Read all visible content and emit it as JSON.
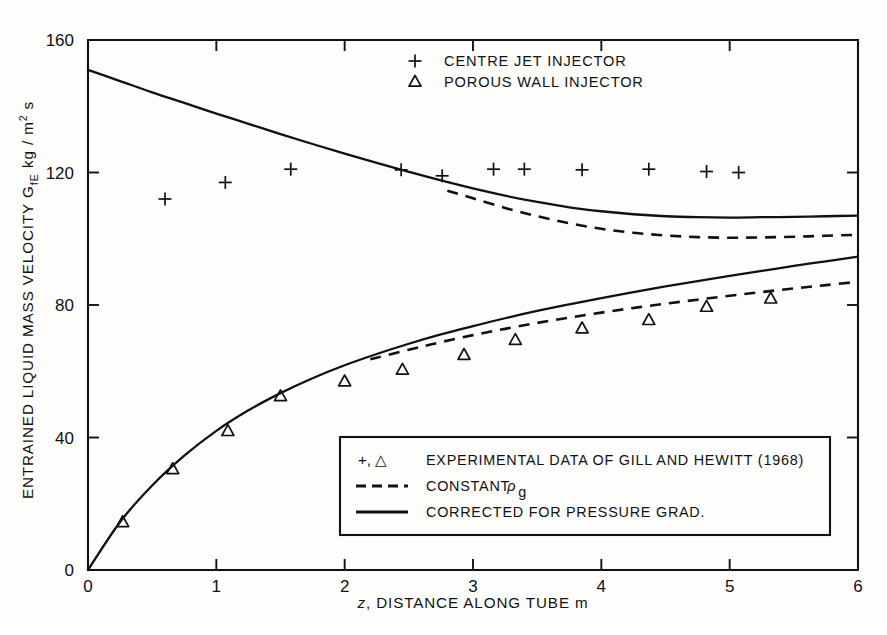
{
  "chart_data": {
    "type": "line",
    "title": "",
    "xlabel": "z, DISTANCE ALONG TUBE m",
    "ylabel": "ENTRAINED LIQUID MASS VELOCITY GfE kg / m2 s",
    "ylabel_parts": {
      "lead": "ENTRAINED LIQUID MASS VELOCITY G",
      "sub": "fE",
      "tail": " kg / m",
      "sup": "2",
      "end": " s"
    },
    "xlabel_parts": {
      "italic": "z",
      "rest": ", DISTANCE ALONG TUBE m"
    },
    "xlim": [
      0,
      6
    ],
    "ylim": [
      0,
      160
    ],
    "xticks": [
      0,
      1,
      2,
      3,
      4,
      5,
      6
    ],
    "xtick_labels": [
      "0",
      "1",
      "2",
      "3",
      "4",
      "5",
      "6"
    ],
    "yticks": [
      0,
      40,
      80,
      120,
      160
    ],
    "ytick_labels": [
      "0",
      "40",
      "80",
      "120",
      "160"
    ],
    "grid": false,
    "frame": "box",
    "series": [
      {
        "name": "centre-jet-corrected-for-pressure-grad",
        "style": "solid",
        "marker": "none",
        "x": [
          0.0,
          0.25,
          0.5,
          0.75,
          1.0,
          1.25,
          1.5,
          1.75,
          2.0,
          2.25,
          2.5,
          2.75,
          3.0,
          3.25,
          3.5,
          3.75,
          4.0,
          4.25,
          4.5,
          4.75,
          5.0,
          5.25,
          5.5,
          5.75,
          6.0
        ],
        "values": [
          151.0,
          147.6,
          144.2,
          141.0,
          137.8,
          134.7,
          131.6,
          128.6,
          125.7,
          122.9,
          120.2,
          117.6,
          115.2,
          113.0,
          111.1,
          109.5,
          108.3,
          107.4,
          106.8,
          106.5,
          106.4,
          106.5,
          106.6,
          106.8,
          107.0
        ]
      },
      {
        "name": "centre-jet-constant-rho-g",
        "style": "dashed",
        "marker": "none",
        "x": [
          2.8,
          3.0,
          3.25,
          3.5,
          3.75,
          4.0,
          4.25,
          4.5,
          4.75,
          5.0,
          5.25,
          5.5,
          5.75,
          6.0
        ],
        "values": [
          114.5,
          112.2,
          109.3,
          106.8,
          104.7,
          103.0,
          101.8,
          101.0,
          100.5,
          100.3,
          100.4,
          100.6,
          100.9,
          101.2
        ]
      },
      {
        "name": "porous-wall-corrected-for-pressure-grad",
        "style": "solid",
        "marker": "none",
        "x": [
          0.0,
          0.25,
          0.5,
          0.75,
          1.0,
          1.25,
          1.5,
          1.75,
          2.0,
          2.25,
          2.5,
          2.75,
          3.0,
          3.25,
          3.5,
          3.75,
          4.0,
          4.25,
          4.5,
          4.75,
          5.0,
          5.25,
          5.5,
          5.75,
          6.0
        ],
        "values": [
          0.0,
          14.5,
          25.5,
          34.5,
          42.0,
          48.2,
          53.4,
          57.9,
          61.8,
          65.2,
          68.3,
          71.1,
          73.6,
          76.0,
          78.2,
          80.2,
          82.1,
          83.9,
          85.6,
          87.2,
          88.8,
          90.3,
          91.8,
          93.2,
          94.6
        ]
      },
      {
        "name": "porous-wall-constant-rho-g",
        "style": "dashed",
        "marker": "none",
        "x": [
          2.2,
          2.5,
          2.75,
          3.0,
          3.25,
          3.5,
          3.75,
          4.0,
          4.25,
          4.5,
          4.75,
          5.0,
          5.25,
          5.5,
          5.75,
          6.0
        ],
        "values": [
          63.6,
          66.5,
          68.8,
          70.9,
          72.8,
          74.6,
          76.2,
          77.7,
          79.1,
          80.4,
          81.6,
          82.8,
          83.9,
          85.0,
          86.0,
          87.0
        ]
      }
    ],
    "scatter": [
      {
        "name": "centre-jet-injector-data",
        "marker": "plus",
        "points": [
          [
            0.6,
            112.0
          ],
          [
            1.07,
            117.0
          ],
          [
            1.58,
            121.0
          ],
          [
            2.44,
            120.8
          ],
          [
            2.76,
            119.0
          ],
          [
            3.16,
            121.0
          ],
          [
            3.4,
            121.0
          ],
          [
            3.85,
            120.8
          ],
          [
            4.37,
            121.0
          ],
          [
            4.82,
            120.3
          ],
          [
            5.07,
            120.0
          ]
        ]
      },
      {
        "name": "porous-wall-injector-data",
        "marker": "triangle",
        "points": [
          [
            0.27,
            14.5
          ],
          [
            0.66,
            30.5
          ],
          [
            1.09,
            42.0
          ],
          [
            1.5,
            52.5
          ],
          [
            2.0,
            57.0
          ],
          [
            2.45,
            60.5
          ],
          [
            2.93,
            65.0
          ],
          [
            3.33,
            69.5
          ],
          [
            3.85,
            73.0
          ],
          [
            4.37,
            75.5
          ],
          [
            4.82,
            79.5
          ],
          [
            5.32,
            82.0
          ]
        ]
      }
    ],
    "legend_top": {
      "position": "top-right-inside",
      "entries": [
        {
          "symbol": "+",
          "label": "CENTRE JET INJECTOR"
        },
        {
          "symbol": "△",
          "label": "POROUS WALL INJECTOR"
        }
      ]
    },
    "legend_box": {
      "position": "bottom-right-inside",
      "entries": [
        {
          "symbol": "+, △",
          "kind": "symbol",
          "label": "EXPERIMENTAL DATA OF GILL AND HEWITT (1968)"
        },
        {
          "symbol": "dashed-rule",
          "kind": "dashed",
          "label": "CONSTANT",
          "label_sub_rho": "ρ",
          "label_sub": "g"
        },
        {
          "symbol": "solid-rule",
          "kind": "solid",
          "label": "CORRECTED FOR PRESSURE GRAD."
        }
      ]
    }
  },
  "colors": {
    "ink": "#111111",
    "background": "#fdfdfc"
  }
}
